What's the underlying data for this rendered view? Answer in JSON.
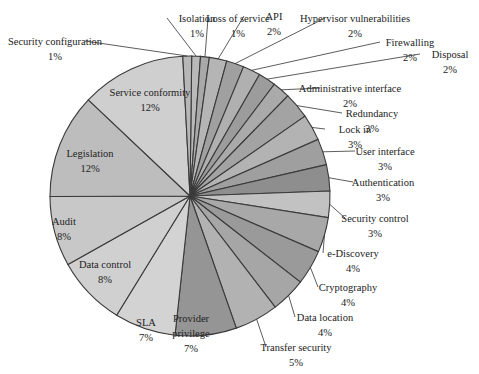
{
  "chart_data": {
    "type": "pie",
    "title": "",
    "start_angle_deg": 0,
    "direction": "clockwise",
    "categories": [
      "Isolation",
      "Loss of service",
      "API",
      "Hypervisor vulnerabilities",
      "Firewalling",
      "Disposal",
      "Administrative interface",
      "Redundancy",
      "Lock in",
      "User interface",
      "Authentication",
      "Security control",
      "e-Discovery",
      "Cryptography",
      "Data location",
      "Transfer security",
      "Provider privilege",
      "SLA",
      "Data control",
      "Audit",
      "Legislation",
      "Service conformity",
      "Security configuration"
    ],
    "values": [
      1,
      1,
      2,
      2,
      2,
      2,
      2,
      3,
      3,
      3,
      3,
      3,
      4,
      4,
      4,
      5,
      7,
      7,
      8,
      8,
      12,
      12,
      1
    ],
    "labels": [
      "1%",
      "1%",
      "2%",
      "2%",
      "2%",
      "2%",
      "2%",
      "3%",
      "3%",
      "3%",
      "3%",
      "3%",
      "4%",
      "4%",
      "4%",
      "5%",
      "7%",
      "7%",
      "8%",
      "8%",
      "12%",
      "12%",
      "1%"
    ],
    "legend": "none",
    "data_labels": "category name and percentage"
  }
}
